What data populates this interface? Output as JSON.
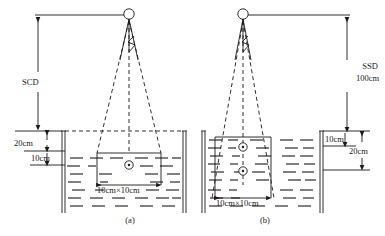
{
  "figure": {
    "type": "technical-line-diagram",
    "background": "#ffffff",
    "ink_color": "#1a1a1a",
    "panels": [
      {
        "id": "a",
        "caption": "(a)",
        "setup": "SCD — source-to-chamber distance, chamber at fixed depth, tank partially filled",
        "source_label": "source-circle",
        "distance_label": "SCD",
        "distance_value": "",
        "depth_labels": [
          "20cm",
          "10cm"
        ],
        "field_size": "10cm×10cm",
        "chamber_count": 1
      },
      {
        "id": "b",
        "caption": "(b)",
        "setup": "SSD — source-to-surface distance 100cm, two chamber depths, tank filled to rim",
        "source_label": "source-circle",
        "distance_label": "SSD",
        "distance_value": "100cm",
        "depth_labels": [
          "10cm",
          "20cm"
        ],
        "field_size": "10cm×10cm",
        "chamber_count": 2
      }
    ],
    "legend_notes": {
      "solid_lines": "collimator / mechanical structure",
      "dashed_lines": "radiation beam divergence edges and central axis",
      "zigzag": "radiation symbol",
      "dash_hatching": "water fill"
    }
  },
  "labels": {
    "scd": "SCD",
    "ssd": "SSD",
    "ssd_value": "100cm",
    "a_20cm": "20cm",
    "a_10cm": "10cm",
    "b_10cm": "10cm",
    "b_20cm": "20cm",
    "field_a": "10cm×10cm",
    "field_b": "10cm×10cm",
    "caption_a": "(a)",
    "caption_b": "(b)"
  }
}
